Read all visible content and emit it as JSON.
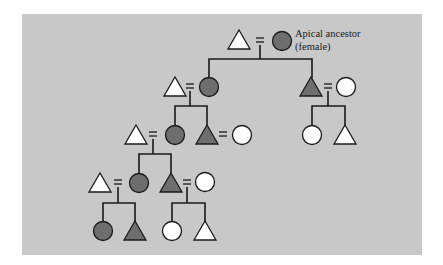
{
  "diagram": {
    "type": "kinship-matrilineal-descent",
    "annotation": {
      "line1": "Apical ancestor",
      "line2": "(female)"
    },
    "legend_semantics": {
      "triangle": "male",
      "circle": "female",
      "equals": "marriage",
      "dark_fill": "member of matrilineage",
      "white_fill": "non-member"
    },
    "colors": {
      "background": "#c8c8c8",
      "member_fill": "#6e6e6e",
      "nonmember_fill": "#ffffff",
      "line": "#1a1a1a"
    },
    "generations": [
      {
        "gen": 1,
        "couples": [
          {
            "husband": "white-triangle",
            "wife": "dark-circle (apical ancestor)"
          }
        ]
      },
      {
        "gen": 2,
        "couples": [
          {
            "husband": "white-triangle",
            "wife": "dark-circle"
          },
          {
            "husband": "dark-triangle",
            "wife": "white-circle"
          }
        ]
      },
      {
        "gen": 3,
        "couples": [
          {
            "husband": "white-triangle",
            "wife": "dark-circle"
          },
          {
            "husband": "dark-triangle",
            "wife": "white-circle"
          }
        ],
        "singles": [
          "white-circle",
          "white-triangle"
        ]
      },
      {
        "gen": 4,
        "couples": [
          {
            "husband": "white-triangle",
            "wife": "dark-circle"
          },
          {
            "husband": "dark-triangle",
            "wife": "white-circle"
          }
        ]
      },
      {
        "gen": 5,
        "singles": [
          "dark-circle",
          "dark-triangle",
          "white-circle",
          "white-triangle"
        ]
      }
    ]
  }
}
